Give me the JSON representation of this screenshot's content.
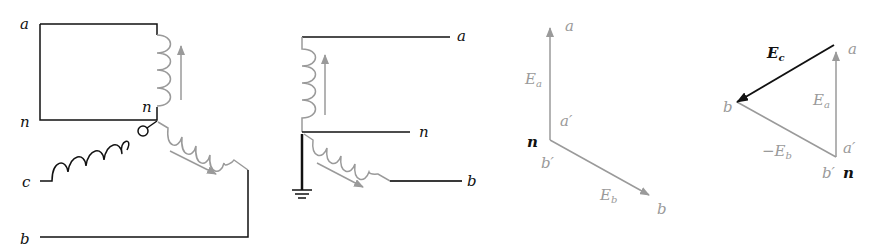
{
  "figure": {
    "panels": [
      {
        "id": "panel-1",
        "description": "Generator winding connection, phases a/b/c around neutral n",
        "labels": {
          "a": "a",
          "n_left": "n",
          "n_center": "n",
          "c": "c",
          "b": "b"
        }
      },
      {
        "id": "panel-2",
        "description": "Grounded neutral, windings a and b",
        "labels": {
          "a": "a",
          "n": "n",
          "b": "b"
        }
      },
      {
        "id": "panel-3",
        "description": "Phasors Ea and Eb from neutral",
        "labels": {
          "a": "a",
          "a_prime": "a′",
          "n": "n",
          "b_prime": "b′",
          "b": "b",
          "Ea": "E",
          "Ea_sub": "a",
          "Eb": "E",
          "Eb_sub": "b"
        }
      },
      {
        "id": "panel-4",
        "description": "Phasor triangle Ec = Ea - Eb",
        "labels": {
          "Ec": "E",
          "Ec_sub": "c",
          "a": "a",
          "b": "b",
          "Ea": "E",
          "Ea_sub": "a",
          "a_prime": "a′",
          "neg_Eb": "−E",
          "neg_Eb_sub": "b",
          "b_prime": "b′",
          "n": "n"
        }
      }
    ],
    "colors": {
      "dark": "#111111",
      "gray": "#9a9a9a"
    }
  }
}
